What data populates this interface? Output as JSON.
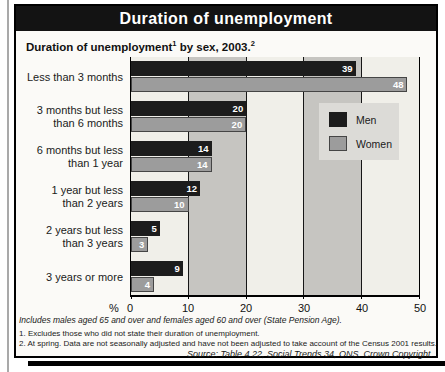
{
  "page": {
    "header": {
      "title": "Duration of unemployment"
    },
    "subtitle": {
      "text1": "Duration of unemployment",
      "sup1": "1",
      "text2": " by sex, 2003.",
      "sup2": "2"
    },
    "axis": {
      "percent_label": "%"
    },
    "footnotes": {
      "note_italic": "Includes males aged 65 and over and females aged 60 and over (State Pension Age).",
      "footnote1": "1. Excludes those who did not state their duration of unemployment.",
      "footnote2": "2. At spring. Data are not seasonally adjusted and have not been adjusted to take account of the Census 2001 results.",
      "source": "Source: Table 4.22, Social Trends 34, ONS. Crown Copyright."
    }
  },
  "chart_data": {
    "type": "bar",
    "orientation": "horizontal",
    "categories": [
      "Less than 3 months",
      "3 months but less than 6 months",
      "6 months but less than 1 year",
      "1 year but less than 2 years",
      "2 years but less than 3 years",
      "3 years or more"
    ],
    "category_label_lines": [
      [
        "Less than 3 months"
      ],
      [
        "3 months but less",
        "than 6 months"
      ],
      [
        "6 months but less",
        "than 1 year"
      ],
      [
        "1 year but less",
        "than 2 years"
      ],
      [
        "2 years but less",
        "than 3 years"
      ],
      [
        "3 years or more"
      ]
    ],
    "series": [
      {
        "name": "Men",
        "color": "#1c1c1c",
        "values": [
          39,
          20,
          14,
          12,
          5,
          9
        ]
      },
      {
        "name": "Women",
        "color": "#9c9c9c",
        "values": [
          48,
          20,
          14,
          10,
          3,
          4
        ]
      }
    ],
    "xlabel": "%",
    "xlim": [
      0,
      50
    ],
    "xticks": [
      0,
      10,
      20,
      30,
      40,
      50
    ],
    "grid": "vertical-black-lines",
    "legend_position": "inside-right",
    "band_colors": [
      "#f0efe9",
      "#c6c5c1"
    ],
    "value_labels": "inside-bar-end-white"
  }
}
